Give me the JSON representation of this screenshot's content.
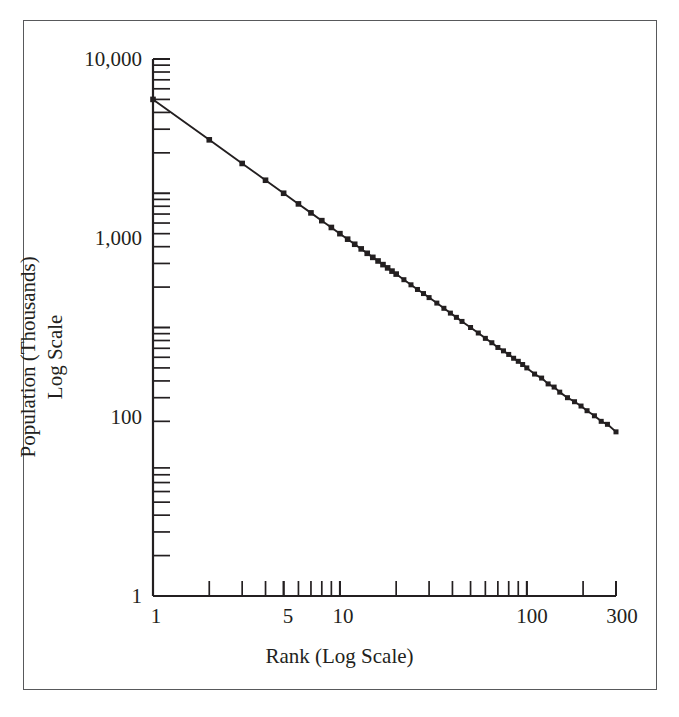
{
  "figure": {
    "background_color": "#ffffff",
    "frame_color": "#58595b",
    "ink_color": "#231f20"
  },
  "chart_data": {
    "type": "line",
    "title": "",
    "subtitle": "",
    "xlabel": "Rank (Log Scale)",
    "ylabel": "Population (Thousands)\nLog Scale",
    "ylabel_line1": "Population (Thousands)",
    "ylabel_line2": "Log Scale",
    "xscale": "log",
    "yscale": "log",
    "xlim": [
      1,
      300
    ],
    "ylim": [
      1,
      10000
    ],
    "grid": false,
    "legend": null,
    "legend_position": "none",
    "marker": "square",
    "marker_color": "#231f20",
    "line_color": "#231f20",
    "xticklabels": [
      "1",
      "5",
      "10",
      "100",
      "300"
    ],
    "xtickvalues": [
      1,
      5,
      10,
      100,
      300
    ],
    "xminorticks": [
      2,
      3,
      4,
      5,
      6,
      7,
      8,
      9,
      10,
      20,
      30,
      40,
      50,
      60,
      70,
      80,
      90,
      100,
      200,
      300
    ],
    "yticklabels": [
      "10,000",
      "1,000",
      "100",
      "1"
    ],
    "ytickvalues": [
      10000,
      1000,
      100,
      1
    ],
    "yminorticks": [
      9000,
      8000,
      7000,
      6000,
      5000,
      4000,
      3000,
      2000,
      900,
      800,
      700,
      600,
      500,
      400,
      300,
      200,
      90,
      80,
      70,
      60,
      50,
      40,
      30,
      20,
      9,
      8,
      7,
      6,
      5,
      4,
      3,
      2
    ],
    "series": [
      {
        "name": "Rank-size distribution",
        "x": [
          1,
          2,
          3,
          4,
          5,
          6,
          7,
          8,
          9,
          10,
          11,
          12,
          13,
          14,
          15,
          16,
          17,
          18,
          19,
          20,
          22,
          24,
          26,
          28,
          30,
          33,
          36,
          39,
          42,
          45,
          50,
          55,
          60,
          65,
          70,
          75,
          80,
          85,
          90,
          95,
          100,
          110,
          120,
          130,
          140,
          150,
          165,
          180,
          195,
          210,
          230,
          250,
          270,
          300
        ],
        "y": [
          5000,
          2500,
          1667,
          1250,
          1000,
          833,
          714,
          625,
          556,
          500,
          455,
          417,
          385,
          357,
          333,
          313,
          294,
          278,
          263,
          250,
          227,
          208,
          192,
          179,
          167,
          152,
          139,
          128,
          119,
          111,
          100,
          91,
          83,
          77,
          71,
          67,
          63,
          59,
          56,
          53,
          50,
          45,
          42,
          38,
          36,
          33,
          30,
          28,
          26,
          24,
          22,
          20,
          19,
          16.7
        ]
      }
    ]
  }
}
